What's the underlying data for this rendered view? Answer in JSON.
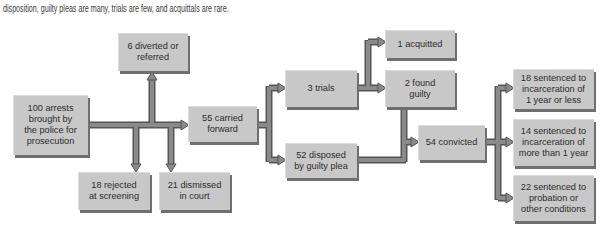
{
  "caption": "disposition, guilty pleas are many, trials are few, and acquittals are rare.",
  "colors": {
    "box_fill": "#c8c8c8",
    "box_shadow": "#6f6f6f",
    "arrow_fill": "#8a8a8a",
    "arrow_outline": "#555555",
    "text": "#2c2c2c"
  },
  "boxes": {
    "arrests": {
      "lines": [
        "100 arrests",
        "brought by",
        "the police for",
        "prosecution"
      ]
    },
    "diverted": {
      "lines": [
        "6 diverted or",
        "referred"
      ]
    },
    "rejected": {
      "lines": [
        "18 rejected",
        "at screening"
      ]
    },
    "dismissed": {
      "lines": [
        "21 dismissed",
        "in court"
      ]
    },
    "carried": {
      "lines": [
        "55 carried",
        "forward"
      ]
    },
    "trials": {
      "lines": [
        "3 trials"
      ]
    },
    "guilty_plea": {
      "lines": [
        "52 disposed",
        "by guilty plea"
      ]
    },
    "acquitted": {
      "lines": [
        "1 acquitted"
      ]
    },
    "found_guilty": {
      "lines": [
        "2 found",
        "guilty"
      ]
    },
    "convicted": {
      "lines": [
        "54 convicted"
      ]
    },
    "sentence_short": {
      "lines": [
        "18 sentenced to",
        "incarceration of",
        "1 year or less"
      ]
    },
    "sentence_long": {
      "lines": [
        "14 sentenced to",
        "incarceration of",
        "more than 1 year"
      ]
    },
    "sentence_probation": {
      "lines": [
        "22 sentenced to",
        "probation or",
        "other conditions"
      ]
    }
  },
  "flows": [
    {
      "from": "arrests",
      "to": "carried"
    },
    {
      "from": "arrests",
      "to": "diverted"
    },
    {
      "from": "arrests",
      "to": "rejected"
    },
    {
      "from": "arrests",
      "to": "dismissed"
    },
    {
      "from": "carried",
      "to": "trials"
    },
    {
      "from": "carried",
      "to": "guilty_plea"
    },
    {
      "from": "trials",
      "to": "acquitted"
    },
    {
      "from": "trials",
      "to": "found_guilty"
    },
    {
      "from": "found_guilty",
      "to": "convicted"
    },
    {
      "from": "guilty_plea",
      "to": "convicted"
    },
    {
      "from": "convicted",
      "to": "sentence_short"
    },
    {
      "from": "convicted",
      "to": "sentence_long"
    },
    {
      "from": "convicted",
      "to": "sentence_probation"
    }
  ]
}
